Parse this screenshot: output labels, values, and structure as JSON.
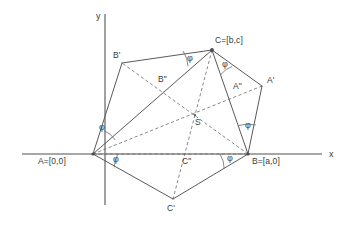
{
  "figure": {
    "background": "#ffffff",
    "stroke_color": "#555555",
    "axis_color": "#808080",
    "text_color": "#3a3a3a",
    "width": 362,
    "height": 233
  },
  "axes": {
    "x_label": "x",
    "y_label": "y",
    "origin": {
      "x": 93,
      "y": 154
    },
    "x_axis": {
      "x1": 22,
      "y1": 154,
      "x2": 322,
      "y2": 154
    },
    "y_axis": {
      "x1": 105,
      "y1": 14,
      "x2": 105,
      "y2": 205
    }
  },
  "points": {
    "A": {
      "label": "A=[0,0]",
      "x": 93,
      "y": 154,
      "label_x": 38,
      "label_y": 160
    },
    "B": {
      "label": "B=[a,0]",
      "x": 248,
      "y": 154,
      "label_x": 251,
      "label_y": 160
    },
    "C": {
      "label": "C=[b,c]",
      "x": 212,
      "y": 50,
      "label_x": 215,
      "label_y": 40
    },
    "A_prime": {
      "label": "A'",
      "x": 262,
      "y": 86,
      "label_x": 268,
      "label_y": 80
    },
    "B_prime": {
      "label": "B'",
      "x": 122,
      "y": 63,
      "label_x": 114,
      "label_y": 54
    },
    "C_prime": {
      "label": "C'",
      "x": 173,
      "y": 199,
      "label_x": 168,
      "label_y": 206
    },
    "A_dprime": {
      "label": "A\"",
      "x": 246,
      "y": 94,
      "label_x": 235,
      "label_y": 85
    },
    "B_dprime": {
      "label": "B\"",
      "x": 167,
      "y": 88,
      "label_x": 159,
      "label_y": 78
    },
    "C_dprime": {
      "label": "C\"",
      "x": 186,
      "y": 154,
      "label_x": 183,
      "label_y": 159
    },
    "S": {
      "label": "S",
      "x": 195,
      "y": 115,
      "label_x": 196,
      "label_y": 121
    }
  },
  "angle_labels": [
    {
      "name": "phi-at-A-upper",
      "text": "φ",
      "x": 101,
      "y": 127
    },
    {
      "name": "phi-at-A-lower",
      "text": "φ",
      "x": 111,
      "y": 158
    },
    {
      "name": "phi-at-C-left",
      "text": "φ",
      "x": 187,
      "y": 57
    },
    {
      "name": "phi-at-C-right",
      "text": "φ",
      "x": 222,
      "y": 63
    },
    {
      "name": "phi-at-B-upper",
      "text": "φ",
      "x": 246,
      "y": 125
    },
    {
      "name": "phi-at-B-lower",
      "text": "φ",
      "x": 226,
      "y": 157
    }
  ],
  "solid_edges": [
    {
      "name": "edge-A-Bprime",
      "from": "A",
      "to": "B_prime"
    },
    {
      "name": "edge-Bprime-C",
      "from": "B_prime",
      "to": "C"
    },
    {
      "name": "edge-C-Aprime",
      "from": "C",
      "to": "A_prime"
    },
    {
      "name": "edge-Aprime-B",
      "from": "A_prime",
      "to": "B"
    },
    {
      "name": "edge-A-C",
      "from": "A",
      "to": "C"
    },
    {
      "name": "edge-A-Cprime",
      "from": "A",
      "to": "C_prime"
    },
    {
      "name": "edge-Cprime-B",
      "from": "C_prime",
      "to": "B"
    },
    {
      "name": "edge-C-B",
      "from": "C",
      "to": "B"
    }
  ],
  "dashed_edges": [
    {
      "name": "cevian-A-Aprime",
      "from": "A",
      "to": "A_prime"
    },
    {
      "name": "cevian-B-Bprime",
      "from": "B",
      "to": "B_prime"
    },
    {
      "name": "cevian-C-Cprime",
      "from": "C",
      "to": "C_prime"
    },
    {
      "name": "median-A-B",
      "from": "A",
      "to": "B"
    }
  ],
  "angle_arcs": [
    {
      "name": "arc-A-upper",
      "cx": 93,
      "cy": 154,
      "r": 26,
      "a1": 295,
      "a2": 329
    },
    {
      "name": "arc-A-lower",
      "cx": 93,
      "cy": 154,
      "r": 25,
      "a1": 0,
      "a2": 32
    },
    {
      "name": "arc-C-left",
      "cx": 212,
      "cy": 50,
      "r": 29,
      "a1": 182,
      "a2": 214
    },
    {
      "name": "arc-C-right",
      "cx": 212,
      "cy": 50,
      "r": 26,
      "a1": 39,
      "a2": 70
    },
    {
      "name": "arc-B-upper",
      "cx": 248,
      "cy": 154,
      "r": 30,
      "a1": 252,
      "a2": 285
    },
    {
      "name": "arc-B-lower",
      "cx": 248,
      "cy": 154,
      "r": 28,
      "a1": 148,
      "a2": 180
    }
  ]
}
